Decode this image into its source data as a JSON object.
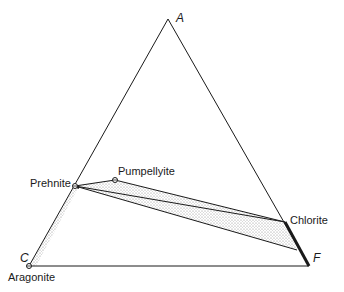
{
  "diagram": {
    "type": "ternary-phase-diagram",
    "vertices": {
      "A": {
        "label": "A",
        "x": 168,
        "y": 19
      },
      "C": {
        "label": "C",
        "x": 29,
        "y": 266
      },
      "F": {
        "label": "F",
        "x": 309,
        "y": 266
      }
    },
    "phases": [
      {
        "name": "Prehnite",
        "label": "Prehnite",
        "x": 75,
        "y": 186
      },
      {
        "name": "Pumpellyite",
        "label": "Pumpellyite",
        "x": 115,
        "y": 180
      },
      {
        "name": "Chlorite",
        "label": "Chlorite",
        "x": 285,
        "y": 222
      },
      {
        "name": "Aragonite",
        "label": "Aragonite",
        "x": 29,
        "y": 266
      }
    ],
    "colors": {
      "line": "#1a1a1a",
      "stipple": "#9a9a9a",
      "background": "#ffffff"
    }
  }
}
